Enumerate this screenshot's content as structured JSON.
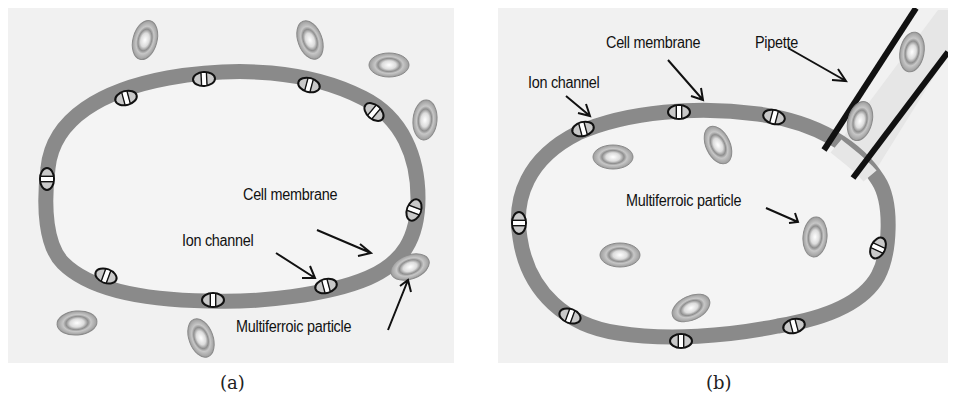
{
  "figure": {
    "panels": [
      {
        "id": "a",
        "caption": "(a)",
        "labels": {
          "cell_membrane": "Cell membrane",
          "ion_channel": "Ion channel",
          "multiferroic_particle": "Multiferroic particle"
        }
      },
      {
        "id": "b",
        "caption": "(b)",
        "labels": {
          "cell_membrane": "Cell membrane",
          "ion_channel": "Ion channel",
          "pipette": "Pipette",
          "multiferroic_particle": "Multiferroic particle"
        }
      }
    ],
    "colors": {
      "background": "#f1f1f1",
      "membrane": "#8a8a8a",
      "cell_interior": "#f3f3f3",
      "particle_outer": "#9a9a9a",
      "particle_ring": "#c4c4c4",
      "particle_core": "#ffffff",
      "ion_channel_stroke": "#111111",
      "pipette": "#111111"
    }
  }
}
